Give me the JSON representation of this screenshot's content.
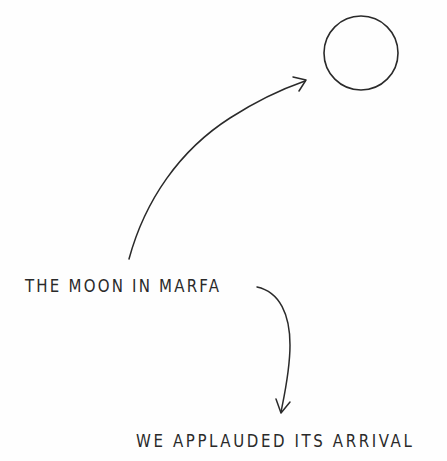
{
  "illustration": {
    "moon_label": "moon",
    "caption_top": "THE MOON  IN  MARFA",
    "caption_bottom": "WE  APPLAUDED  ITS  ARRIVAL",
    "ink_color": "#2a2a2a",
    "background_color": "#fefefe"
  }
}
